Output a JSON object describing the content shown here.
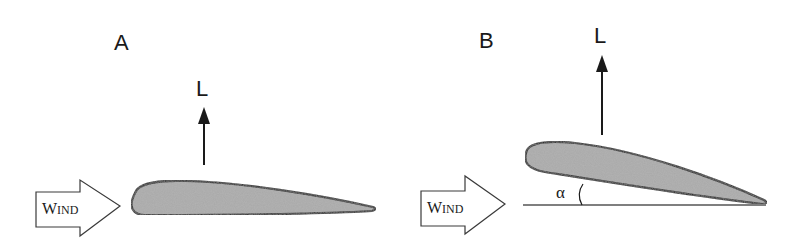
{
  "figure": {
    "panels": [
      {
        "id": "A",
        "label": "A",
        "lift_label": "L",
        "wind_label_first": "W",
        "wind_label_rest": "IND",
        "angle_of_attack_shown": false
      },
      {
        "id": "B",
        "label": "B",
        "lift_label": "L",
        "wind_label_first": "W",
        "wind_label_rest": "IND",
        "angle_of_attack_shown": true,
        "angle_label": "α"
      }
    ],
    "colors": {
      "stroke": "#1a1a1a",
      "airfoil_fill": "#a9a9a9",
      "wind_arrow_fill": "#ffffff",
      "background": "#ffffff"
    }
  }
}
